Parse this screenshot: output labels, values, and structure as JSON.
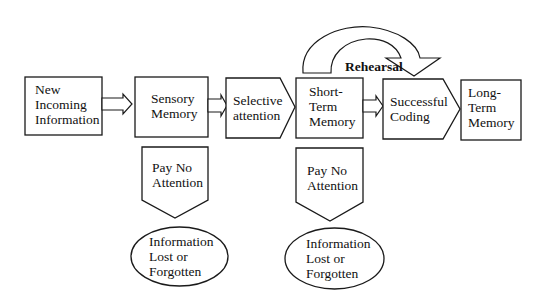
{
  "diagram": {
    "title": "",
    "nodes": {
      "new_info": {
        "label": "New\nIncoming\nInformation",
        "shape": "rectangle"
      },
      "sensory": {
        "label": "Sensory\nMemory",
        "shape": "rectangle"
      },
      "selective": {
        "label": "Selective\nattention",
        "shape": "pentagon-right"
      },
      "short_term": {
        "label": "Short-\nTerm\nMemory",
        "shape": "rectangle"
      },
      "coding": {
        "label": "Successful\nCoding",
        "shape": "pentagon-right"
      },
      "long_term": {
        "label": "Long-\nTerm\nMemory",
        "shape": "rectangle"
      },
      "pay_no_attention_1": {
        "label": "Pay No\nAttention",
        "shape": "pentagon-down"
      },
      "pay_no_attention_2": {
        "label": "Pay No\nAttention",
        "shape": "pentagon-down"
      },
      "lost_1": {
        "label": "Information\nLost or\nForgotten",
        "shape": "ellipse"
      },
      "lost_2": {
        "label": "Information\nLost or\nForgotten",
        "shape": "ellipse"
      }
    },
    "rehearsal_label": "Rehearsal",
    "edges": [
      {
        "from": "new_info",
        "to": "sensory",
        "type": "block-arrow"
      },
      {
        "from": "sensory",
        "to": "selective",
        "type": "block-arrow"
      },
      {
        "from": "selective",
        "to": "short_term",
        "type": "adjacent"
      },
      {
        "from": "short_term",
        "to": "coding",
        "type": "block-arrow"
      },
      {
        "from": "coding",
        "to": "long_term",
        "type": "adjacent"
      },
      {
        "from": "short_term",
        "to": "short_term",
        "type": "curved-arrow",
        "label": "Rehearsal"
      },
      {
        "from": "sensory",
        "to": "pay_no_attention_1",
        "type": "below"
      },
      {
        "from": "pay_no_attention_1",
        "to": "lost_1",
        "type": "below"
      },
      {
        "from": "short_term",
        "to": "pay_no_attention_2",
        "type": "below"
      },
      {
        "from": "pay_no_attention_2",
        "to": "lost_2",
        "type": "below"
      }
    ],
    "colors": {
      "stroke": "#1a1a1a",
      "fill": "#ffffff",
      "text": "#111111"
    }
  }
}
